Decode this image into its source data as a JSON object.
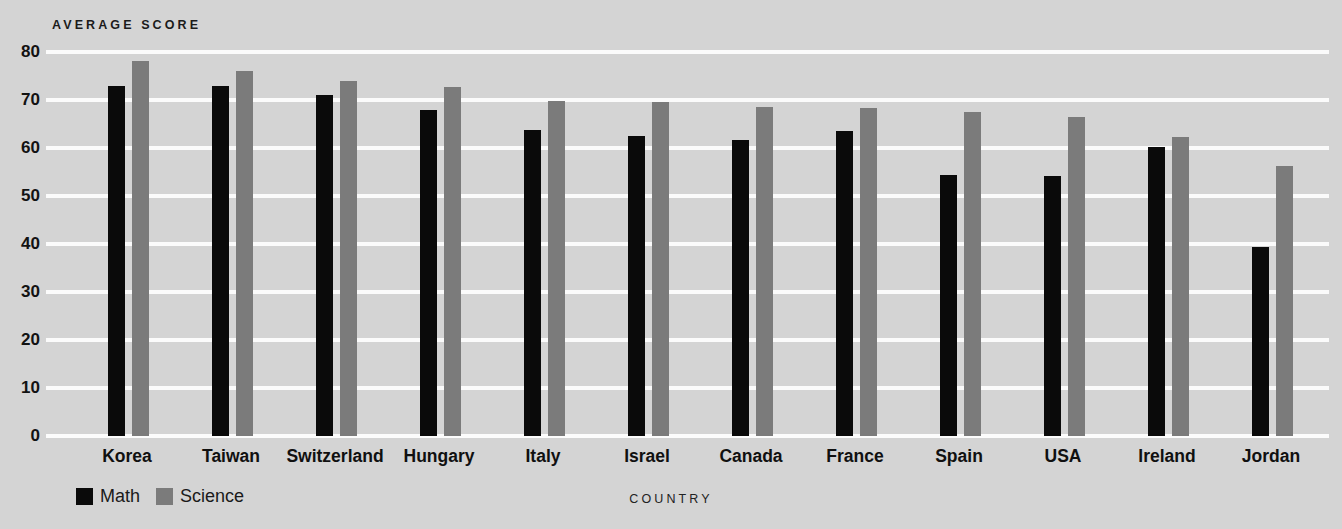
{
  "chart_data": {
    "type": "bar",
    "title": "",
    "xlabel": "COUNTRY",
    "ylabel": "AVERAGE SCORE",
    "ylim": [
      0,
      80
    ],
    "yticks": [
      0,
      10,
      20,
      30,
      40,
      50,
      60,
      70,
      80
    ],
    "grid": true,
    "legend_position": "bottom-left",
    "categories": [
      "Korea",
      "Taiwan",
      "Switzerland",
      "Hungary",
      "Italy",
      "Israel",
      "Canada",
      "France",
      "Spain",
      "USA",
      "Ireland",
      "Jordan"
    ],
    "series": [
      {
        "name": "Math",
        "color": "#0a0a0a",
        "values": [
          73.0,
          73.0,
          71.0,
          68.0,
          63.7,
          62.6,
          61.7,
          63.6,
          54.4,
          54.2,
          60.3,
          39.3
        ]
      },
      {
        "name": "Science",
        "color": "#7b7b7b",
        "values": [
          78.2,
          76.0,
          74.0,
          72.8,
          69.7,
          69.5,
          68.5,
          68.4,
          67.5,
          66.4,
          62.3,
          56.3
        ]
      }
    ]
  },
  "colors": {
    "background": "#d4d4d4",
    "gridline": "#fbfbfb",
    "math": "#0a0a0a",
    "science": "#7b7b7b",
    "text": "#111111"
  }
}
